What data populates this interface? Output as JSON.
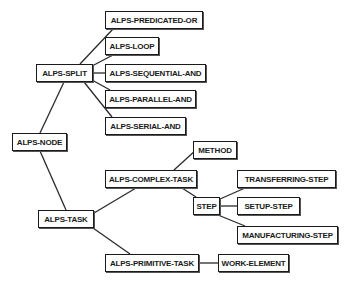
{
  "diagram": {
    "type": "tree",
    "nodes": [
      {
        "id": "alps-node",
        "label": "ALPS-NODE",
        "x": 12,
        "y": 133,
        "w": 55,
        "h": 18
      },
      {
        "id": "alps-split",
        "label": "ALPS-SPLIT",
        "x": 36,
        "y": 64,
        "w": 57,
        "h": 18
      },
      {
        "id": "alps-predicated-or",
        "label": "ALPS-PREDICATED-OR",
        "x": 105,
        "y": 11,
        "w": 98,
        "h": 18
      },
      {
        "id": "alps-loop",
        "label": "ALPS-LOOP",
        "x": 105,
        "y": 37,
        "w": 54,
        "h": 18
      },
      {
        "id": "alps-sequential-and",
        "label": "ALPS-SEQUENTIAL-AND",
        "x": 105,
        "y": 64,
        "w": 101,
        "h": 18
      },
      {
        "id": "alps-parallel-and",
        "label": "ALPS-PARALLEL-AND",
        "x": 105,
        "y": 90,
        "w": 91,
        "h": 18
      },
      {
        "id": "alps-serial-and",
        "label": "ALPS-SERIAL-AND",
        "x": 105,
        "y": 117,
        "w": 81,
        "h": 18
      },
      {
        "id": "alps-task",
        "label": "ALPS-TASK",
        "x": 38,
        "y": 210,
        "w": 56,
        "h": 18
      },
      {
        "id": "alps-complex-task",
        "label": "ALPS-COMPLEX-TASK",
        "x": 105,
        "y": 170,
        "w": 92,
        "h": 18
      },
      {
        "id": "method",
        "label": "METHOD",
        "x": 193,
        "y": 141,
        "w": 44,
        "h": 18
      },
      {
        "id": "step",
        "label": "STEP",
        "x": 193,
        "y": 197,
        "w": 27,
        "h": 18
      },
      {
        "id": "transferring-step",
        "label": "TRANSFERRING-STEP",
        "x": 237,
        "y": 170,
        "w": 99,
        "h": 18
      },
      {
        "id": "setup-step",
        "label": "SETUP-STEP",
        "x": 237,
        "y": 197,
        "w": 63,
        "h": 18
      },
      {
        "id": "manufacturing-step",
        "label": "MANUFACTURING-STEP",
        "x": 237,
        "y": 226,
        "w": 101,
        "h": 18
      },
      {
        "id": "alps-primitive-task",
        "label": "ALPS-PRIMITIVE-TASK",
        "x": 105,
        "y": 254,
        "w": 94,
        "h": 18
      },
      {
        "id": "work-element",
        "label": "WORK-ELEMENT",
        "x": 218,
        "y": 254,
        "w": 71,
        "h": 18
      }
    ],
    "edges": [
      {
        "from": "alps-node",
        "to": "alps-split",
        "x1": 40,
        "y1": 133,
        "x2": 64,
        "y2": 82
      },
      {
        "from": "alps-node",
        "to": "alps-task",
        "x1": 40,
        "y1": 151,
        "x2": 66,
        "y2": 210
      },
      {
        "from": "alps-split",
        "to": "alps-predicated-or",
        "x1": 80,
        "y1": 64,
        "x2": 113,
        "y2": 29
      },
      {
        "from": "alps-split",
        "to": "alps-loop",
        "x1": 92,
        "y1": 66,
        "x2": 113,
        "y2": 55
      },
      {
        "from": "alps-split",
        "to": "alps-sequential-and",
        "x1": 93,
        "y1": 73,
        "x2": 105,
        "y2": 73
      },
      {
        "from": "alps-split",
        "to": "alps-parallel-and",
        "x1": 92,
        "y1": 80,
        "x2": 110,
        "y2": 90
      },
      {
        "from": "alps-split",
        "to": "alps-serial-and",
        "x1": 84,
        "y1": 82,
        "x2": 112,
        "y2": 117
      },
      {
        "from": "alps-task",
        "to": "alps-complex-task",
        "x1": 94,
        "y1": 213,
        "x2": 136,
        "y2": 188
      },
      {
        "from": "alps-task",
        "to": "alps-primitive-task",
        "x1": 93,
        "y1": 228,
        "x2": 130,
        "y2": 254
      },
      {
        "from": "alps-complex-task",
        "to": "method",
        "x1": 174,
        "y1": 170,
        "x2": 196,
        "y2": 150
      },
      {
        "from": "alps-complex-task",
        "to": "step",
        "x1": 182,
        "y1": 188,
        "x2": 196,
        "y2": 197
      },
      {
        "from": "step",
        "to": "transferring-step",
        "x1": 220,
        "y1": 199,
        "x2": 245,
        "y2": 188
      },
      {
        "from": "step",
        "to": "setup-step",
        "x1": 220,
        "y1": 206,
        "x2": 237,
        "y2": 206
      },
      {
        "from": "step",
        "to": "manufacturing-step",
        "x1": 218,
        "y1": 215,
        "x2": 245,
        "y2": 226
      },
      {
        "from": "alps-primitive-task",
        "to": "work-element",
        "x1": 199,
        "y1": 263,
        "x2": 218,
        "y2": 263
      }
    ]
  }
}
